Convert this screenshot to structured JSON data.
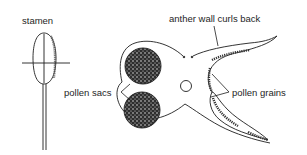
{
  "diagram": {
    "labels": {
      "stamen": "stamen",
      "anther_wall": "anther wall curls back",
      "pollen_sacs": "pollen sacs",
      "pollen_grains": "pollen grains"
    },
    "colors": {
      "line": "#1e1e1e",
      "background": "#ffffff",
      "stipple": "#3a3a3a"
    }
  }
}
